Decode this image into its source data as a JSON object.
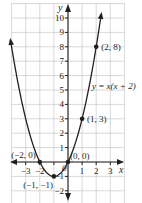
{
  "chart_data": {
    "type": "line",
    "title": "",
    "xlabel": "x",
    "ylabel": "y",
    "equation_label": "y = x(x + 2)",
    "xlim": [
      -4,
      4
    ],
    "ylim": [
      -3,
      11
    ],
    "grid": true,
    "x_ticks": [
      -3,
      -2,
      -1,
      1,
      2,
      3
    ],
    "y_ticks": [
      -2,
      -1,
      1,
      2,
      3,
      4,
      5,
      6,
      7,
      8,
      9,
      10
    ],
    "x_tick_labels": [
      "−3",
      "−2",
      "",
      "1",
      "2",
      "3"
    ],
    "y_tick_labels": [
      "−2",
      "−1",
      "1",
      "2",
      "3",
      "4",
      "5",
      "6",
      "7",
      "8",
      "9",
      "10"
    ],
    "origin_label": "0",
    "series": [
      {
        "name": "y = x(x + 2)",
        "function": "x*(x+2)",
        "x": [
          -4.08,
          -4,
          -3,
          -2,
          -1,
          0,
          1,
          2,
          2.35
        ],
        "values": [
          7.3,
          8,
          3,
          0,
          -1,
          0,
          3,
          8,
          10.2
        ]
      }
    ],
    "points": [
      {
        "x": 2,
        "y": 8,
        "label": "(2, 8)"
      },
      {
        "x": 1,
        "y": 3,
        "label": "(1, 3)"
      },
      {
        "x": 0,
        "y": 0,
        "label": "(0, 0)"
      },
      {
        "x": -2,
        "y": 0,
        "label": "(−2, 0)"
      },
      {
        "x": -1,
        "y": -1,
        "label": "(−1, −1)"
      }
    ],
    "colors": {
      "curve": "#231f20",
      "grid": "#c8c8c8",
      "axis": "#231f20",
      "points": "#231f20"
    }
  }
}
